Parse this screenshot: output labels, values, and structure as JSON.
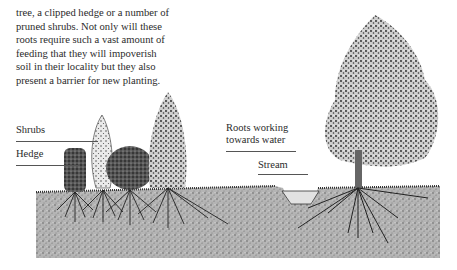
{
  "text": {
    "lines": [
      "tree, a clipped hedge or a number of",
      "pruned shrubs. Not only will these",
      "roots require such a vast amount of",
      "feeding that they will impoverish",
      "soil in their locality but they also",
      "present a barrier for new planting."
    ]
  },
  "illustration": {
    "labels": {
      "shrubs": "Shrubs",
      "hedge": "Hedge",
      "roots": [
        "Roots working",
        "towards water"
      ],
      "stream": "Stream"
    },
    "colors": {
      "ink": "#1e1e1e",
      "soil": "#9a9a9a",
      "water": "#dcdcdc"
    }
  }
}
